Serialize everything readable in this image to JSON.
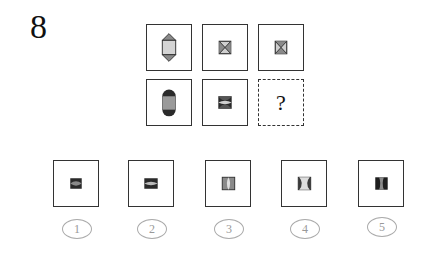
{
  "question": {
    "number": "8"
  },
  "grid": {
    "cells": [
      {
        "id": "r1c1",
        "shape": "hexagon-arrows-vertical"
      },
      {
        "id": "r1c2",
        "shape": "square-x-small"
      },
      {
        "id": "r1c3",
        "shape": "square-x-small"
      },
      {
        "id": "r2c1",
        "shape": "capsule-vertical"
      },
      {
        "id": "r2c2",
        "shape": "hourglass-horizontal-dark"
      },
      {
        "id": "r2c3",
        "shape": "unknown",
        "label": "?"
      }
    ]
  },
  "options": [
    {
      "label": "1",
      "shape": "hourglass-horizontal-dark"
    },
    {
      "label": "2",
      "shape": "hourglass-horizontal-dark-wide"
    },
    {
      "label": "3",
      "shape": "hourglass-vertical-gray"
    },
    {
      "label": "4",
      "shape": "hourglass-vertical-light"
    },
    {
      "label": "5",
      "shape": "hourglass-vertical-dark"
    }
  ],
  "colors": {
    "border": "#333333",
    "dark": "#2a2a2a",
    "mid": "#8a8a8a",
    "light": "#cfcfcf"
  }
}
